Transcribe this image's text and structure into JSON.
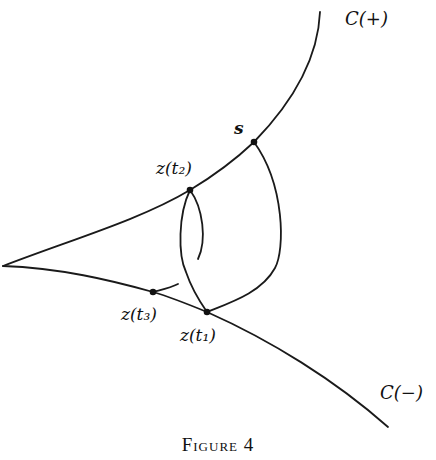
{
  "figure": {
    "caption": "Figure 4",
    "labels": {
      "c_plus": "C(+)",
      "c_minus": "C(−)",
      "s": "s",
      "z_t1": "z(t₁)",
      "z_t2": "z(t₂)",
      "z_t3": "z(t₃)"
    },
    "stroke_color": "#1a1a1a",
    "background": "#ffffff"
  }
}
